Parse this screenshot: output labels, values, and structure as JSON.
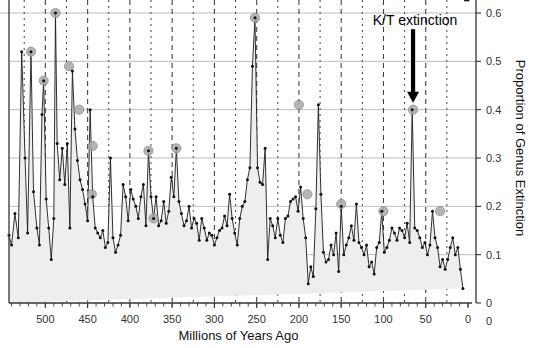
{
  "chart_data": {
    "type": "line",
    "title": "",
    "xlabel": "Millions of Years Ago",
    "ylabel": "Proportion of Genus Extinction",
    "xlim": [
      543,
      0
    ],
    "ylim": [
      0,
      0.62
    ],
    "x_reversed": true,
    "grid": "horizontal solid gray, vertical dashed every 25 Myr",
    "legend": "none",
    "x_ticks_major": [
      500,
      450,
      400,
      350,
      300,
      250,
      200,
      150,
      100,
      50,
      0
    ],
    "x_tick_labels": [
      "500",
      "450",
      "400",
      "350",
      "300",
      "250",
      "200",
      "150",
      "100",
      "50",
      "0"
    ],
    "x_gridlines_dashed": [
      525,
      500,
      475,
      450,
      425,
      400,
      375,
      350,
      325,
      300,
      275,
      250,
      225,
      200,
      175,
      150,
      125,
      100,
      75,
      50,
      25
    ],
    "y_ticks": [
      0,
      0.1,
      0.2,
      0.3,
      0.4,
      0.5,
      0.6
    ],
    "y_tick_labels": [
      "0",
      "0.1",
      "0.2",
      "0.3",
      "0.4",
      "0.5",
      "0.6"
    ],
    "series_name": "Proportion of Genus Extinction",
    "area_fill": true,
    "annotations": [
      {
        "text": "K/T extinction",
        "x": 65,
        "y": 0.55,
        "arrow_to_x": 65,
        "arrow_to_y": 0.4
      }
    ],
    "highlighted_points": [
      {
        "x": 517,
        "y": 0.52
      },
      {
        "x": 502,
        "y": 0.46
      },
      {
        "x": 488,
        "y": 0.6
      },
      {
        "x": 472,
        "y": 0.49
      },
      {
        "x": 460,
        "y": 0.4
      },
      {
        "x": 444,
        "y": 0.325
      },
      {
        "x": 445,
        "y": 0.225
      },
      {
        "x": 378,
        "y": 0.315
      },
      {
        "x": 372,
        "y": 0.175
      },
      {
        "x": 345,
        "y": 0.32
      },
      {
        "x": 252,
        "y": 0.59
      },
      {
        "x": 200,
        "y": 0.41
      },
      {
        "x": 190,
        "y": 0.225
      },
      {
        "x": 150,
        "y": 0.205
      },
      {
        "x": 100,
        "y": 0.19
      },
      {
        "x": 65,
        "y": 0.4
      },
      {
        "x": 33,
        "y": 0.19
      }
    ],
    "x": [
      543,
      540,
      536,
      532,
      528,
      524,
      521,
      517,
      514,
      510,
      507,
      504,
      502,
      499,
      496,
      493,
      490,
      488,
      486,
      483,
      480,
      477,
      474,
      471,
      468,
      465,
      462,
      459,
      456,
      453,
      450,
      447,
      444,
      441,
      438,
      435,
      432,
      429,
      426,
      423,
      420,
      417,
      414,
      411,
      408,
      405,
      402,
      399,
      396,
      393,
      390,
      387,
      384,
      381,
      378,
      375,
      372,
      369,
      366,
      363,
      360,
      357,
      354,
      351,
      348,
      345,
      342,
      339,
      336,
      333,
      330,
      327,
      324,
      321,
      318,
      315,
      312,
      309,
      306,
      303,
      300,
      297,
      294,
      291,
      288,
      285,
      282,
      279,
      276,
      273,
      270,
      267,
      264,
      261,
      258,
      255,
      252,
      249,
      246,
      243,
      240,
      237,
      234,
      231,
      228,
      225,
      222,
      219,
      216,
      213,
      210,
      207,
      204,
      201,
      198,
      195,
      192,
      189,
      186,
      183,
      180,
      177,
      174,
      171,
      168,
      165,
      162,
      159,
      156,
      153,
      150,
      147,
      144,
      141,
      138,
      135,
      132,
      129,
      126,
      123,
      120,
      117,
      114,
      111,
      108,
      105,
      102,
      99,
      96,
      93,
      90,
      87,
      84,
      81,
      78,
      75,
      72,
      69,
      66,
      63,
      60,
      57,
      54,
      51,
      48,
      45,
      42,
      39,
      36,
      33,
      30,
      27,
      24,
      21,
      18,
      15,
      12,
      9,
      6,
      3,
      0
    ],
    "y": [
      0.14,
      0.12,
      0.185,
      0.135,
      0.52,
      0.3,
      0.145,
      0.52,
      0.23,
      0.155,
      0.12,
      0.39,
      0.46,
      0.215,
      0.155,
      0.09,
      0.175,
      0.6,
      0.33,
      0.255,
      0.32,
      0.245,
      0.33,
      0.155,
      0.48,
      0.36,
      0.295,
      0.255,
      0.235,
      0.205,
      0.17,
      0.4,
      0.22,
      0.155,
      0.145,
      0.135,
      0.15,
      0.115,
      0.125,
      0.3,
      0.135,
      0.105,
      0.12,
      0.14,
      0.245,
      0.22,
      0.17,
      0.235,
      0.215,
      0.2,
      0.175,
      0.22,
      0.245,
      0.16,
      0.315,
      0.22,
      0.175,
      0.22,
      0.16,
      0.17,
      0.21,
      0.165,
      0.19,
      0.26,
      0.22,
      0.32,
      0.21,
      0.185,
      0.16,
      0.17,
      0.2,
      0.155,
      0.175,
      0.165,
      0.13,
      0.175,
      0.155,
      0.13,
      0.145,
      0.14,
      0.12,
      0.135,
      0.15,
      0.155,
      0.18,
      0.16,
      0.225,
      0.175,
      0.145,
      0.12,
      0.175,
      0.2,
      0.21,
      0.255,
      0.28,
      0.49,
      0.59,
      0.28,
      0.25,
      0.245,
      0.32,
      0.09,
      0.175,
      0.16,
      0.135,
      0.175,
      0.14,
      0.125,
      0.175,
      0.18,
      0.21,
      0.215,
      0.22,
      0.19,
      0.24,
      0.175,
      0.135,
      0.04,
      0.075,
      0.055,
      0.195,
      0.41,
      0.225,
      0.105,
      0.085,
      0.09,
      0.12,
      0.1,
      0.145,
      0.065,
      0.2,
      0.1,
      0.12,
      0.135,
      0.16,
      0.13,
      0.205,
      0.125,
      0.115,
      0.1,
      0.12,
      0.075,
      0.085,
      0.06,
      0.115,
      0.125,
      0.19,
      0.105,
      0.115,
      0.13,
      0.155,
      0.145,
      0.13,
      0.155,
      0.15,
      0.135,
      0.165,
      0.125,
      0.4,
      0.155,
      0.15,
      0.135,
      0.115,
      0.125,
      0.1,
      0.12,
      0.19,
      0.135,
      0.115,
      0.075,
      0.09,
      0.07,
      0.09,
      0.115,
      0.135,
      0.1,
      0.115,
      0.07,
      0.03
    ]
  },
  "axis": {
    "x_title": "Millions of Years Ago",
    "y_title": "Proportion of Genus Extinction"
  },
  "annotation": {
    "kt_label": "K/T extinction"
  },
  "colors": {
    "line": "#1a1a1a",
    "marker": "#111111",
    "highlight": "#a8a8a8",
    "fill": "#eeeeee",
    "grid_h": "#bdbdbd",
    "grid_v": "#444444",
    "axis": "#333333",
    "background": "#ffffff"
  }
}
